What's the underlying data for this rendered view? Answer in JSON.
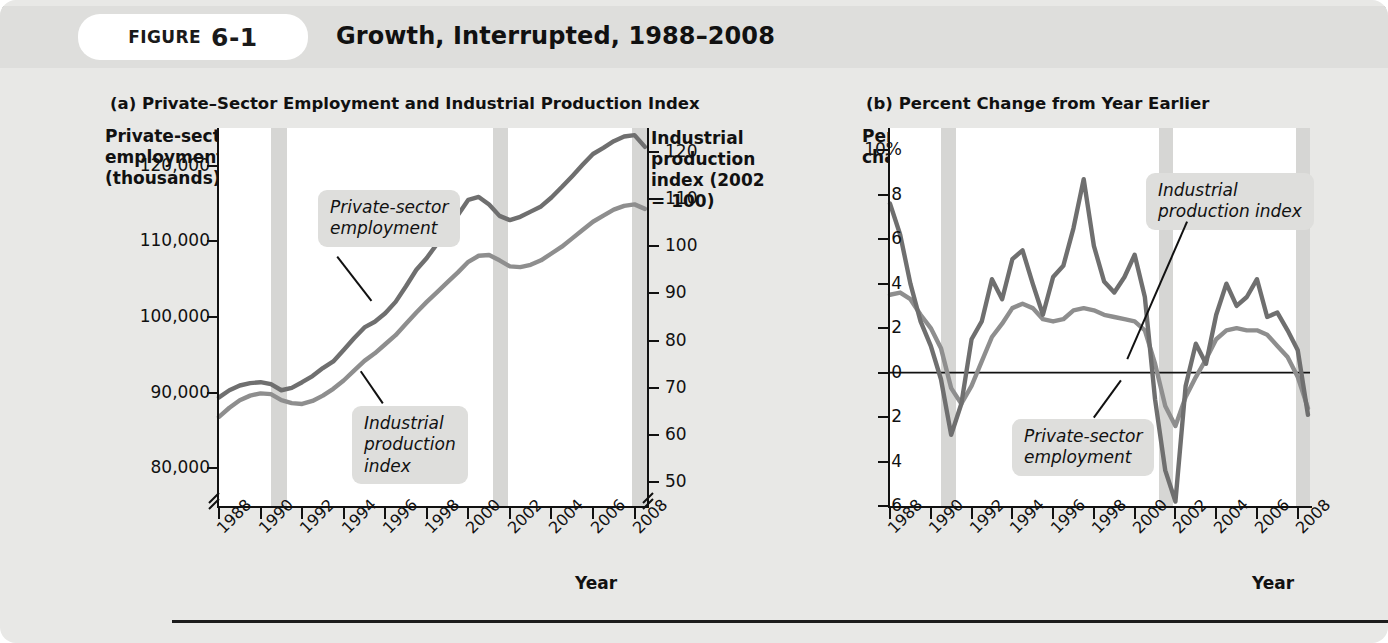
{
  "header": {
    "figure_word": "FIGURE",
    "figure_number": "6-1",
    "title": "Growth, Interrupted, 1988–2008"
  },
  "panel_a": {
    "title": "(a) Private–Sector Employment and Industrial Production Index",
    "y_left_title": "Private-sector\nemployment\n(thousands)",
    "y_right_title": "Industrial\nproduction\nindex (2002\n= 100)",
    "x_title": "Year",
    "y_left_ticks": [
      "120,000",
      "110,000",
      "100,000",
      "90,000",
      "80,000"
    ],
    "y_right_ticks": [
      "120",
      "110",
      "100",
      "90",
      "80",
      "70",
      "60",
      "50"
    ],
    "x_ticks": [
      "1988",
      "1990",
      "1992",
      "1994",
      "1996",
      "1998",
      "2000",
      "2002",
      "2004",
      "2006",
      "2008"
    ],
    "callout_employment": "Private-sector\nemployment",
    "callout_production": "Industrial\nproduction\nindex"
  },
  "panel_b": {
    "title": "(b) Percent Change from Year Earlier",
    "y_title": "Percent\nchange",
    "x_title": "Year",
    "y_ticks": [
      "10%",
      "8",
      "6",
      "4",
      "2",
      "0",
      "−2",
      "−4",
      "−6"
    ],
    "x_ticks": [
      "1988",
      "1990",
      "1992",
      "1994",
      "1996",
      "1998",
      "2000",
      "2002",
      "2004",
      "2006",
      "2008"
    ],
    "callout_production": "Industrial\nproduction index",
    "callout_employment": "Private-sector\nemployment"
  },
  "colors": {
    "card_background": "#e8e8e6",
    "plot_background": "#ffffff",
    "recession_band": "#d6d6d4",
    "employment_line": "#8e8e8e",
    "production_line": "#6f6f6f",
    "callout_background": "#dededc",
    "axis": "#111111"
  },
  "chart_data": [
    {
      "type": "line",
      "panel": "a",
      "title": "(a) Private–Sector Employment and Industrial Production Index",
      "xlabel": "Year",
      "ylabel": "Private-sector employment (thousands)",
      "ylabel_right": "Industrial production index (2002 = 100)",
      "xlim": [
        1988,
        2008.6
      ],
      "ylim_left": [
        75000,
        125000
      ],
      "ylim_right": [
        45,
        125
      ],
      "grid": false,
      "legend": "callout-annotations",
      "axis_break": true,
      "recession_bands": [
        [
          1990.5,
          1991.25
        ],
        [
          2001.2,
          2001.9
        ],
        [
          2007.9,
          2008.6
        ]
      ],
      "x": [
        1988,
        1988.5,
        1989,
        1989.5,
        1990,
        1990.5,
        1991,
        1991.5,
        1992,
        1992.5,
        1993,
        1993.5,
        1994,
        1994.5,
        1995,
        1995.5,
        1996,
        1996.5,
        1997,
        1997.5,
        1998,
        1998.5,
        1999,
        1999.5,
        2000,
        2000.5,
        2001,
        2001.5,
        2002,
        2002.5,
        2003,
        2003.5,
        2004,
        2004.5,
        2005,
        2005.5,
        2006,
        2006.5,
        2007,
        2007.5,
        2008,
        2008.5
      ],
      "series": [
        {
          "name": "Private-sector employment",
          "axis": "left",
          "values": [
            86800,
            88000,
            89000,
            89600,
            89900,
            89800,
            89000,
            88600,
            88500,
            88900,
            89600,
            90500,
            91600,
            92900,
            94200,
            95200,
            96400,
            97600,
            99100,
            100600,
            102000,
            103300,
            104600,
            105900,
            107300,
            108100,
            108200,
            107500,
            106700,
            106600,
            106900,
            107500,
            108400,
            109300,
            110400,
            111500,
            112600,
            113400,
            114200,
            114700,
            114900,
            114300
          ]
        },
        {
          "name": "Industrial production index",
          "axis": "right",
          "values": [
            68,
            69.5,
            70.5,
            71,
            71.2,
            70.8,
            69.5,
            70,
            71.2,
            72.5,
            74.2,
            75.6,
            78,
            80.5,
            82.8,
            84,
            85.8,
            88.2,
            91.5,
            95,
            97.5,
            100.5,
            104,
            106.6,
            109.8,
            110.4,
            108.8,
            106.4,
            105.5,
            106.2,
            107.3,
            108.4,
            110.3,
            112.5,
            114.8,
            117.2,
            119.5,
            120.8,
            122.2,
            123.2,
            123.5,
            121
          ]
        }
      ]
    },
    {
      "type": "line",
      "panel": "b",
      "title": "(b) Percent Change from Year Earlier",
      "xlabel": "Year",
      "ylabel": "Percent change",
      "xlim": [
        1988,
        2008.6
      ],
      "ylim": [
        -6,
        11
      ],
      "grid": false,
      "zero_line": true,
      "legend": "callout-annotations",
      "axis_break": false,
      "recession_bands": [
        [
          1990.5,
          1991.25
        ],
        [
          2001.2,
          2001.9
        ],
        [
          2007.9,
          2008.6
        ]
      ],
      "x": [
        1988,
        1988.5,
        1989,
        1989.5,
        1990,
        1990.5,
        1991,
        1991.5,
        1992,
        1992.5,
        1993,
        1993.5,
        1994,
        1994.5,
        1995,
        1995.5,
        1996,
        1996.5,
        1997,
        1997.5,
        1998,
        1998.5,
        1999,
        1999.5,
        2000,
        2000.5,
        2001,
        2001.5,
        2002,
        2002.5,
        2003,
        2003.5,
        2004,
        2004.5,
        2005,
        2005.5,
        2006,
        2006.5,
        2007,
        2007.5,
        2008,
        2008.5
      ],
      "series": [
        {
          "name": "Private-sector employment",
          "values": [
            3.5,
            3.6,
            3.3,
            2.6,
            2.0,
            1.1,
            -0.7,
            -1.4,
            -0.6,
            0.5,
            1.6,
            2.2,
            2.9,
            3.1,
            2.9,
            2.4,
            2.3,
            2.4,
            2.8,
            2.9,
            2.8,
            2.6,
            2.5,
            2.4,
            2.3,
            1.9,
            0.4,
            -1.5,
            -2.4,
            -1.1,
            -0.2,
            0.6,
            1.5,
            1.9,
            2.0,
            1.9,
            1.9,
            1.7,
            1.2,
            0.7,
            -0.2,
            -1.6
          ]
        },
        {
          "name": "Industrial production index",
          "values": [
            7.6,
            6.2,
            4.0,
            2.3,
            1.2,
            -0.3,
            -2.8,
            -1.4,
            1.5,
            2.3,
            4.2,
            3.3,
            5.1,
            5.5,
            4.0,
            2.6,
            4.3,
            4.8,
            6.5,
            8.7,
            5.7,
            4.1,
            3.6,
            4.3,
            5.3,
            3.4,
            -1.2,
            -4.4,
            -5.8,
            -0.6,
            1.3,
            0.4,
            2.6,
            4.0,
            3.0,
            3.4,
            4.2,
            2.5,
            2.7,
            1.9,
            1.0,
            -1.9
          ]
        }
      ]
    }
  ]
}
